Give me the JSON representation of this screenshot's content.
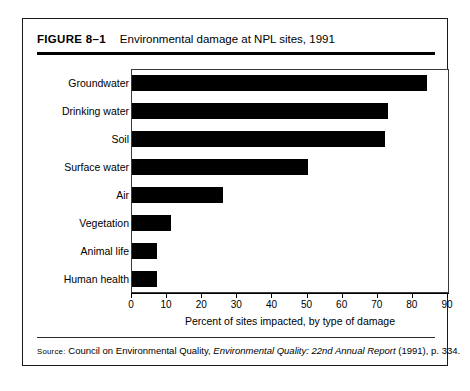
{
  "figure": {
    "number": "FIGURE 8–1",
    "title": "Environmental damage at NPL sites, 1991"
  },
  "source": {
    "label": "Source:",
    "prefix": " Council on Environmental Quality, ",
    "italic_title": "Environmental Quality: 22nd Annual Report",
    "suffix": " (1991), p. 334."
  },
  "chart_data": {
    "type": "bar",
    "orientation": "horizontal",
    "title": "Environmental damage at NPL sites, 1991",
    "xlabel": "Percent of sites impacted, by type of damage",
    "ylabel": "",
    "xlim": [
      0,
      90
    ],
    "xticks": [
      0,
      10,
      20,
      30,
      40,
      50,
      60,
      70,
      80,
      90
    ],
    "xtick_labels": [
      "0",
      "10",
      "20",
      "30",
      "40",
      "50",
      "60",
      "70",
      "80",
      "90"
    ],
    "grid": false,
    "legend": "none",
    "bar_color": "#000000",
    "categories": [
      "Groundwater",
      "Drinking water",
      "Soil",
      "Surface water",
      "Air",
      "Vegetation",
      "Animal life",
      "Human health"
    ],
    "values": [
      84,
      73,
      72,
      50,
      26,
      11,
      7,
      7
    ]
  }
}
